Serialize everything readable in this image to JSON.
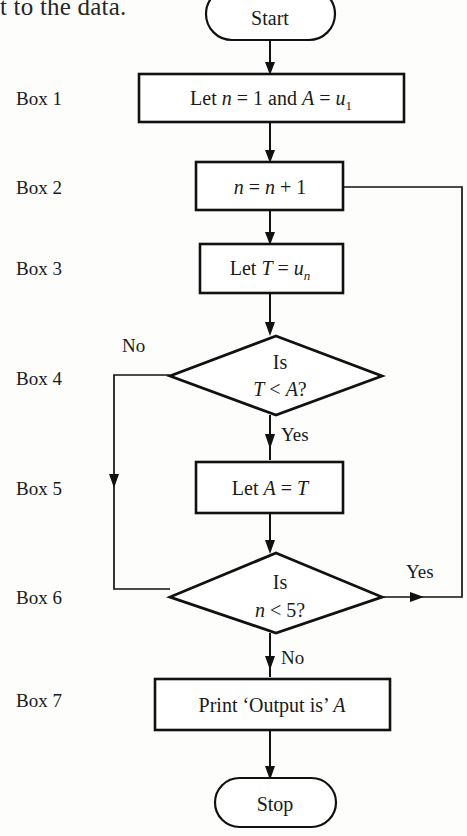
{
  "page": {
    "width": 467,
    "height": 836,
    "background_color": "#fdfdfc",
    "ink_color": "#111111",
    "clipped_body_text": "t to the data."
  },
  "diagram": {
    "type": "flowchart",
    "row_labels": [
      {
        "id": "label-box-1",
        "text": "Box 1"
      },
      {
        "id": "label-box-2",
        "text": "Box 2"
      },
      {
        "id": "label-box-3",
        "text": "Box 3"
      },
      {
        "id": "label-box-4",
        "text": "Box 4"
      },
      {
        "id": "label-box-5",
        "text": "Box 5"
      },
      {
        "id": "label-box-6",
        "text": "Box 6"
      },
      {
        "id": "label-box-7",
        "text": "Box 7"
      }
    ],
    "nodes": [
      {
        "id": "start",
        "shape": "terminator",
        "text": "Start"
      },
      {
        "id": "box1",
        "shape": "process",
        "text": "Let n = 1 and A = u1",
        "parts": [
          "Let ",
          "n",
          " = 1 and ",
          "A",
          " = ",
          "u",
          "1"
        ]
      },
      {
        "id": "box2",
        "shape": "process",
        "text": "n = n + 1",
        "parts": [
          "n",
          " = ",
          "n",
          " + 1"
        ]
      },
      {
        "id": "box3",
        "shape": "process",
        "text": "Let T = un",
        "parts": [
          "Let ",
          "T",
          " = ",
          "u",
          "n"
        ]
      },
      {
        "id": "box4",
        "shape": "decision",
        "line1": "Is",
        "line2": "T < A?",
        "parts2": [
          "T",
          " < ",
          "A",
          "?"
        ]
      },
      {
        "id": "box5",
        "shape": "process",
        "text": "Let A = T",
        "parts": [
          "Let ",
          "A",
          " = ",
          "T"
        ]
      },
      {
        "id": "box6",
        "shape": "decision",
        "line1": "Is",
        "line2": "n < 5?",
        "parts2": [
          "n",
          " < 5?"
        ]
      },
      {
        "id": "box7",
        "shape": "process",
        "text": "Print ‘Output is’ A",
        "parts": [
          "Print ‘Output is’ ",
          "A"
        ]
      },
      {
        "id": "stop",
        "shape": "terminator",
        "text": "Stop"
      }
    ],
    "edges": [
      {
        "id": "edge-start-box1",
        "from": "start",
        "to": "box1",
        "label": ""
      },
      {
        "id": "edge-box1-box2",
        "from": "box1",
        "to": "box2",
        "label": ""
      },
      {
        "id": "edge-box2-box3",
        "from": "box2",
        "to": "box3",
        "label": ""
      },
      {
        "id": "edge-box3-box4",
        "from": "box3",
        "to": "box4",
        "label": ""
      },
      {
        "id": "edge-box4-no",
        "from": "box4",
        "to": "box6",
        "label": "No",
        "label_id": "edge-label-no-box4"
      },
      {
        "id": "edge-box4-yes",
        "from": "box4",
        "to": "box5",
        "label": "Yes",
        "label_id": "edge-label-yes-box4"
      },
      {
        "id": "edge-box5-box6",
        "from": "box5",
        "to": "box6",
        "label": ""
      },
      {
        "id": "edge-box6-yes",
        "from": "box6",
        "to": "box2",
        "label": "Yes",
        "label_id": "edge-label-yes-box6"
      },
      {
        "id": "edge-box6-no",
        "from": "box6",
        "to": "box7",
        "label": "No",
        "label_id": "edge-label-no-box6"
      },
      {
        "id": "edge-box7-stop",
        "from": "box7",
        "to": "stop",
        "label": ""
      }
    ],
    "edge_labels": {
      "box4_no": "No",
      "box4_yes": "Yes",
      "box6_yes": "Yes",
      "box6_no": "No"
    }
  }
}
